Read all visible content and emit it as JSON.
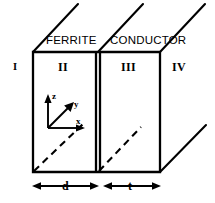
{
  "figure": {
    "title_materials": {
      "left": "FERRITE",
      "right": "CONDUCTOR"
    },
    "regions": [
      {
        "id": "region-1",
        "label": "I"
      },
      {
        "id": "region-2",
        "label": "II"
      },
      {
        "id": "region-3",
        "label": "III"
      },
      {
        "id": "region-4",
        "label": "IV"
      }
    ],
    "axes": [
      {
        "id": "axis-z",
        "label": "z"
      },
      {
        "id": "axis-y",
        "label": "y"
      },
      {
        "id": "axis-x",
        "label": "x"
      }
    ],
    "dimensions": [
      {
        "id": "dimension-d",
        "label": "d"
      },
      {
        "id": "dimension-t",
        "label": "t"
      }
    ],
    "colors": {
      "ink": "#000000",
      "background": "#ffffff"
    }
  }
}
